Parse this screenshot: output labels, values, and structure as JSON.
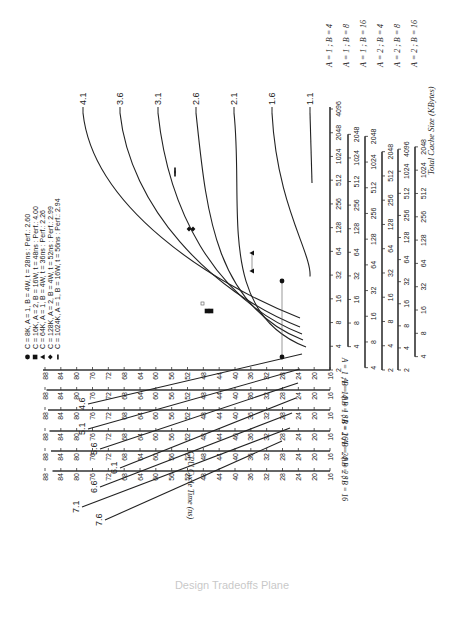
{
  "chart_data": {
    "type": "line",
    "title": "",
    "xlabel": "Total Cache Size (KBytes)",
    "ylabel": "CPU Cycle Time (ns)",
    "x_scale": "log2",
    "contours": {
      "description": "Iso-performance contour lines",
      "labels": [
        "4.1",
        "3.6",
        "3.1",
        "2.6",
        "2.1",
        "1.6",
        "1.1",
        "4.6",
        "5.1",
        "5.6",
        "6.1",
        "6.6",
        "7.1",
        "7.6"
      ]
    },
    "x_axes": [
      {
        "name": "A = 1 ; B = 4",
        "ticks": [
          "2",
          "4",
          "8",
          "16",
          "32",
          "64",
          "128",
          "256",
          "512",
          "1024",
          "2048",
          "4096"
        ]
      },
      {
        "name": "A = 1 ; B = 8",
        "ticks": [
          "4",
          "8",
          "16",
          "32",
          "64",
          "128",
          "256",
          "512",
          "1024",
          "2048"
        ]
      },
      {
        "name": "A = 1 ; B = 16",
        "ticks": [
          "4",
          "8",
          "16",
          "32",
          "64",
          "128",
          "256",
          "512",
          "1024",
          "2048"
        ]
      },
      {
        "name": "A = 2 ; B = 4",
        "ticks": [
          "2",
          "4",
          "8",
          "16",
          "32",
          "64",
          "128",
          "256",
          "512",
          "2048"
        ]
      },
      {
        "name": "A = 2 ; B = 8",
        "ticks": [
          "2",
          "4",
          "8",
          "16",
          "32",
          "64",
          "128",
          "256",
          "512",
          "1024",
          "4096"
        ]
      },
      {
        "name": "A = 2 ; B = 16",
        "ticks": [
          "4",
          "8",
          "16",
          "32",
          "64",
          "128",
          "256",
          "512",
          "1024",
          "2048"
        ]
      }
    ],
    "y_axes": [
      {
        "name": "A = 1 ; B = 4",
        "ticks": [
          "16",
          "20",
          "24",
          "28",
          "32",
          "36",
          "40",
          "44",
          "48",
          "52",
          "56",
          "60",
          "64",
          "68",
          "72",
          "76",
          "80",
          "84",
          "88"
        ]
      },
      {
        "name": "A = 1 ; B = 8",
        "ticks": [
          "16",
          "20",
          "24",
          "28",
          "32",
          "36",
          "40",
          "44",
          "48",
          "52",
          "56",
          "60",
          "64",
          "68",
          "72",
          "76",
          "80",
          "84",
          "88"
        ]
      },
      {
        "name": "A = 1 ; B = 16",
        "ticks": [
          "16",
          "20",
          "24",
          "28",
          "32",
          "36",
          "40",
          "44",
          "48",
          "52",
          "56",
          "60",
          "64",
          "68",
          "72",
          "76",
          "80",
          "84",
          "88"
        ]
      },
      {
        "name": "A = 2 ; B = 4",
        "ticks": [
          "16",
          "20",
          "24",
          "28",
          "32",
          "36",
          "40",
          "44",
          "48",
          "52",
          "56",
          "60",
          "64",
          "68",
          "72",
          "76",
          "80",
          "84",
          "88"
        ]
      },
      {
        "name": "A = 2 ; B = 8",
        "ticks": [
          "16",
          "20",
          "24",
          "28",
          "32",
          "36",
          "40",
          "44",
          "48",
          "52",
          "56",
          "60",
          "64",
          "68",
          "72",
          "76",
          "80",
          "84",
          "88"
        ]
      },
      {
        "name": "A = 2 ; B = 16",
        "ticks": [
          "16",
          "20",
          "24",
          "28",
          "32",
          "36",
          "40",
          "44",
          "48",
          "52",
          "56",
          "60",
          "64",
          "68",
          "72",
          "76",
          "80",
          "84",
          "88"
        ]
      }
    ],
    "legend": [
      {
        "marker": "circle",
        "label": "C = 8K, A = 1, B = 4W, t = 28ns : Perf.: 2.60"
      },
      {
        "marker": "square",
        "label": "C = 16K, A = 2, B = 16W, t = 48ns : Perf.: 4.00"
      },
      {
        "marker": "triangle",
        "label": "C = 64K, A = 1, B = 4W, t = 36ns : Perf.: 2.26"
      },
      {
        "marker": "diamond",
        "label": "C = 128K, A = 2, B = 4W, t = 52ns : Perf.: 2.99"
      },
      {
        "marker": "dash",
        "label": "C = 1024K, A = 1, B = 16W, t = 56ns : Perf.: 2.94"
      }
    ],
    "points": [
      {
        "series": "8K",
        "cache_kb": 8,
        "cycle_ns": 28
      },
      {
        "series": "16K",
        "cache_kb": 16,
        "cycle_ns": 48
      },
      {
        "series": "64K",
        "cache_kb": 64,
        "cycle_ns": 36
      },
      {
        "series": "128K",
        "cache_kb": 128,
        "cycle_ns": 52
      },
      {
        "series": "1024K",
        "cache_kb": 1024,
        "cycle_ns": 56
      }
    ],
    "caption": "Design Tradeoffs Plane"
  }
}
